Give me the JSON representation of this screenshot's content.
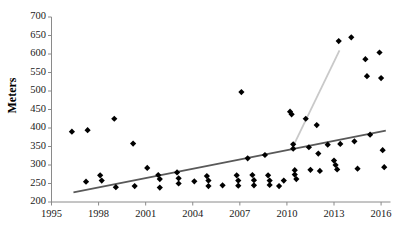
{
  "chart_data": {
    "type": "scatter",
    "title": "",
    "xlabel": "",
    "ylabel": "Meters",
    "xlim": [
      1995,
      2016.6
    ],
    "ylim": [
      200,
      700
    ],
    "grid": false,
    "legend": "none",
    "xticks": [
      1995,
      1998,
      2001,
      2004,
      2007,
      2010,
      2013,
      2016
    ],
    "yticks": [
      200,
      250,
      300,
      350,
      400,
      450,
      500,
      550,
      600,
      650,
      700
    ],
    "marker": "diamond",
    "marker_color": "#000000",
    "points": [
      {
        "x": 1996.3,
        "y": 390
      },
      {
        "x": 1997.2,
        "y": 255
      },
      {
        "x": 1997.3,
        "y": 394
      },
      {
        "x": 1998.1,
        "y": 272
      },
      {
        "x": 1998.2,
        "y": 258
      },
      {
        "x": 1999.0,
        "y": 425
      },
      {
        "x": 1999.1,
        "y": 240
      },
      {
        "x": 2000.2,
        "y": 358
      },
      {
        "x": 2000.3,
        "y": 243
      },
      {
        "x": 2001.1,
        "y": 292
      },
      {
        "x": 2001.8,
        "y": 273
      },
      {
        "x": 2001.9,
        "y": 262
      },
      {
        "x": 2001.9,
        "y": 239
      },
      {
        "x": 2003.0,
        "y": 280
      },
      {
        "x": 2003.1,
        "y": 264
      },
      {
        "x": 2003.1,
        "y": 250
      },
      {
        "x": 2004.1,
        "y": 256
      },
      {
        "x": 2004.9,
        "y": 270
      },
      {
        "x": 2005.0,
        "y": 258
      },
      {
        "x": 2005.0,
        "y": 243
      },
      {
        "x": 2005.9,
        "y": 245
      },
      {
        "x": 2006.8,
        "y": 272
      },
      {
        "x": 2006.9,
        "y": 258
      },
      {
        "x": 2006.9,
        "y": 244
      },
      {
        "x": 2007.1,
        "y": 497
      },
      {
        "x": 2007.5,
        "y": 318
      },
      {
        "x": 2007.8,
        "y": 273
      },
      {
        "x": 2007.9,
        "y": 259
      },
      {
        "x": 2007.9,
        "y": 245
      },
      {
        "x": 2008.6,
        "y": 327
      },
      {
        "x": 2008.8,
        "y": 272
      },
      {
        "x": 2008.9,
        "y": 258
      },
      {
        "x": 2008.9,
        "y": 246
      },
      {
        "x": 2009.5,
        "y": 243
      },
      {
        "x": 2009.8,
        "y": 258
      },
      {
        "x": 2010.2,
        "y": 444
      },
      {
        "x": 2010.3,
        "y": 437
      },
      {
        "x": 2010.4,
        "y": 356
      },
      {
        "x": 2010.4,
        "y": 344
      },
      {
        "x": 2010.5,
        "y": 286
      },
      {
        "x": 2010.5,
        "y": 274
      },
      {
        "x": 2010.6,
        "y": 262
      },
      {
        "x": 2011.2,
        "y": 425
      },
      {
        "x": 2011.4,
        "y": 348
      },
      {
        "x": 2011.5,
        "y": 287
      },
      {
        "x": 2011.9,
        "y": 408
      },
      {
        "x": 2012.0,
        "y": 331
      },
      {
        "x": 2012.1,
        "y": 284
      },
      {
        "x": 2012.6,
        "y": 355
      },
      {
        "x": 2013.0,
        "y": 312
      },
      {
        "x": 2013.1,
        "y": 300
      },
      {
        "x": 2013.2,
        "y": 288
      },
      {
        "x": 2013.3,
        "y": 635
      },
      {
        "x": 2013.4,
        "y": 357
      },
      {
        "x": 2014.1,
        "y": 645
      },
      {
        "x": 2014.3,
        "y": 364
      },
      {
        "x": 2014.5,
        "y": 290
      },
      {
        "x": 2015.0,
        "y": 586
      },
      {
        "x": 2015.1,
        "y": 540
      },
      {
        "x": 2015.3,
        "y": 382
      },
      {
        "x": 2015.9,
        "y": 604
      },
      {
        "x": 2016.0,
        "y": 535
      },
      {
        "x": 2016.1,
        "y": 340
      },
      {
        "x": 2016.2,
        "y": 294
      }
    ],
    "lines": [
      {
        "name": "overall-trend-line",
        "color": "#595959",
        "width": 1.8,
        "x0": 1996.4,
        "y0": 226,
        "x1": 2016.3,
        "y1": 393
      },
      {
        "name": "recent-steep-trend-line",
        "color": "#c9c9c9",
        "width": 1.8,
        "x0": 2010.4,
        "y0": 351,
        "x1": 2013.35,
        "y1": 610
      }
    ]
  }
}
